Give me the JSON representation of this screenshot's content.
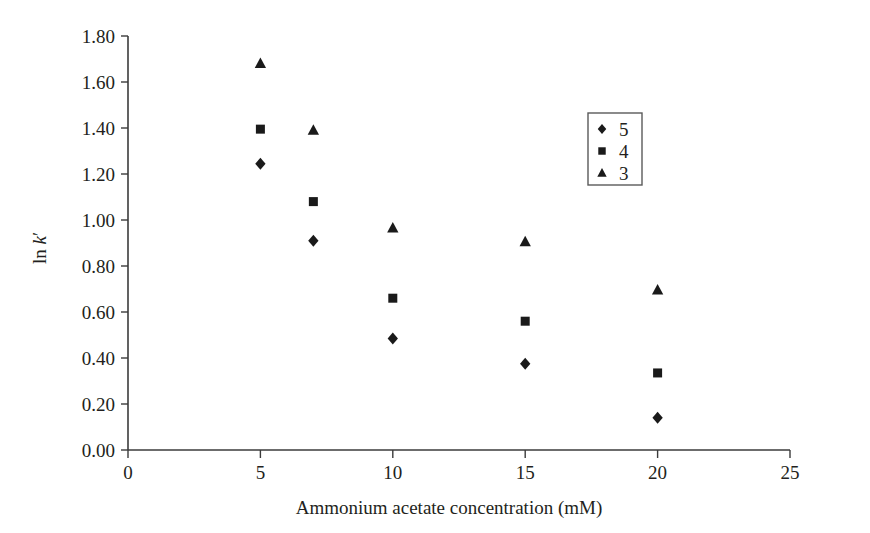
{
  "chart_data": {
    "type": "scatter",
    "title": "",
    "xlabel": "Ammonium acetate concentration (mM)",
    "ylabel": "ln k′",
    "ylabel_parts": {
      "prefix": "ln ",
      "symbol": "k",
      "prime": "′"
    },
    "xlim": [
      0,
      25
    ],
    "ylim": [
      0.0,
      1.8
    ],
    "xticks": [
      0,
      5,
      10,
      15,
      20,
      25
    ],
    "xtick_labels": [
      "0",
      "5",
      "10",
      "15",
      "20",
      "25"
    ],
    "yticks": [
      0.0,
      0.2,
      0.4,
      0.6,
      0.8,
      1.0,
      1.2,
      1.4,
      1.6,
      1.8
    ],
    "ytick_labels": [
      "0.00",
      "0.20",
      "0.40",
      "0.60",
      "0.80",
      "1.00",
      "1.20",
      "1.40",
      "1.60",
      "1.80"
    ],
    "grid": false,
    "legend_position": "upper-right-inside",
    "x": [
      5,
      7,
      10,
      15,
      20
    ],
    "series": [
      {
        "name": "5",
        "marker": "diamond",
        "color": "#1a1a1a",
        "values": [
          1.245,
          0.91,
          0.485,
          0.375,
          0.14
        ]
      },
      {
        "name": "4",
        "marker": "square",
        "color": "#1a1a1a",
        "values": [
          1.395,
          1.08,
          0.66,
          0.56,
          0.335
        ]
      },
      {
        "name": "3",
        "marker": "triangle",
        "color": "#1a1a1a",
        "values": [
          1.68,
          1.39,
          0.965,
          0.905,
          0.695
        ]
      }
    ]
  },
  "legend": {
    "entries": [
      {
        "marker": "diamond",
        "label": "5"
      },
      {
        "marker": "square",
        "label": "4"
      },
      {
        "marker": "triangle",
        "label": "3"
      }
    ]
  },
  "colors": {
    "marker": "#1a1a1a",
    "axis": "#3b3b3b",
    "text": "#231f20",
    "background": "#ffffff",
    "legend_border": "#5a5a5a"
  }
}
